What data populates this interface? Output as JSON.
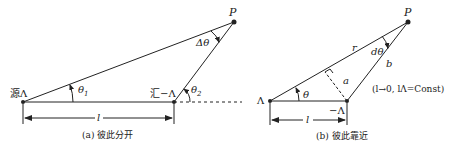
{
  "panel_a": {
    "source_label": "源Λ",
    "sink_label": "汇−Λ",
    "point_label": "P",
    "theta1": "θ",
    "theta1_sub": "1",
    "theta2": "θ",
    "theta2_sub": "2",
    "delta_theta": "Δθ",
    "length_label": "l",
    "caption": "(a) 彼此分开"
  },
  "panel_b": {
    "source_label": "Λ",
    "sink_label": "−Λ",
    "point_label": "P",
    "theta": "θ",
    "d_theta": "dθ",
    "r_label": "r",
    "a_label": "a",
    "b_label": "b",
    "length_label": "l",
    "condition": "(l→0, lΛ=Const)",
    "caption": "(b) 彼此靠近"
  }
}
